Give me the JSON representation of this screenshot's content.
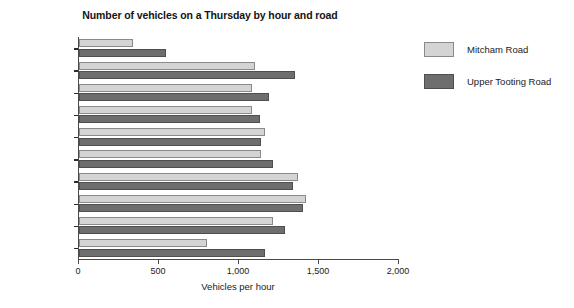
{
  "chart_data": {
    "type": "bar",
    "orientation": "horizontal",
    "title": "Number of vehicles on a Thursday by hour and road",
    "xlabel": "Vehicles per hour",
    "ylabel": "",
    "xlim": [
      0,
      2000
    ],
    "xticks": [
      0,
      500,
      1000,
      1500,
      2000
    ],
    "xtick_labels": [
      "0",
      "500",
      "1,000",
      "1,500",
      "2,000"
    ],
    "grid": false,
    "legend_position": "right",
    "categories": [
      "01.00-02.00",
      "07.00-08.00",
      "09.00-10.00",
      "11.00-12.00",
      "13.00-14.00",
      "15.00-16.00",
      "17.00-18.00",
      "19.00-20.00",
      "21.00-22.00",
      "23.00-24.00"
    ],
    "series": [
      {
        "name": "Mitcham Road",
        "color": "#d4d4d4",
        "values": [
          340,
          1100,
          1080,
          1080,
          1160,
          1140,
          1370,
          1420,
          1210,
          800
        ]
      },
      {
        "name": "Upper Tooting Road",
        "color": "#6e6e6e",
        "values": [
          545,
          1350,
          1190,
          1130,
          1140,
          1210,
          1340,
          1400,
          1290,
          1160
        ]
      }
    ]
  },
  "legend": {
    "items": [
      {
        "label": "Mitcham Road",
        "swatch": "light"
      },
      {
        "label": "Upper Tooting Road",
        "swatch": "dark"
      }
    ]
  }
}
